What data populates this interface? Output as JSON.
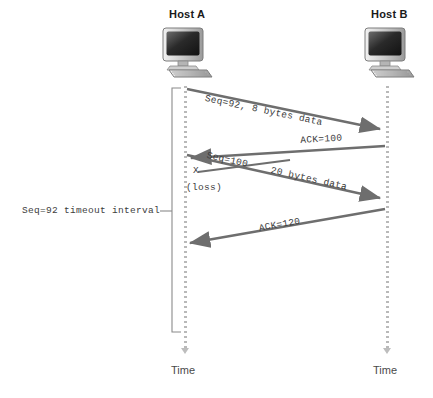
{
  "diagram": {
    "hosts": [
      {
        "name": "host-a",
        "label": "Host A",
        "time_label": "Time"
      },
      {
        "name": "host-b",
        "label": "Host B",
        "time_label": "Time"
      }
    ],
    "messages": [
      {
        "id": "seq92",
        "label": "Seq=92, 8 bytes data",
        "direction": "a-to-b"
      },
      {
        "id": "ack100",
        "label": "ACK=100",
        "direction": "b-to-a"
      },
      {
        "id": "seq100",
        "label": "Seq=100",
        "direction": "a-to-b"
      },
      {
        "id": "bytes20",
        "label": "20 bytes data",
        "direction": "a-to-b"
      },
      {
        "id": "ack120",
        "label": "ACK=120",
        "direction": "b-to-a"
      }
    ],
    "annotations": {
      "loss_marker": "X",
      "loss_text": "(loss)",
      "timeout_label": "Seq=92 timeout interval"
    },
    "colors": {
      "arrow": "#6e6e6e",
      "timeline": "#b9b9b9",
      "text": "#3d3d3d",
      "host_text": "#1a1a1a",
      "bracket": "#8a8a8a"
    }
  }
}
